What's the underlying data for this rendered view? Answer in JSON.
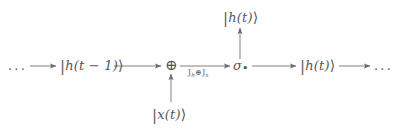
{
  "diagram": {
    "type": "unrolled-recurrence-flow",
    "title": "",
    "stroke_color": "#6b6b6b",
    "text_color": "#575757",
    "background": "#ffffff",
    "nodes": [
      {
        "id": "left-ellipsis",
        "name": "left-ellipsis",
        "text": "...",
        "x": 8,
        "y": 60
      },
      {
        "id": "prev-hidden-state",
        "name": "ket-h-t-minus-1",
        "text_parts": {
          "bar": "|",
          "body": "h(t − 1)",
          "rangle": "⟩"
        },
        "text": "|h(t − 1)⟩",
        "x": 60,
        "y": 58
      },
      {
        "id": "adder",
        "name": "circled-plus-operator",
        "text": "⊕",
        "x": 166,
        "y": 60
      },
      {
        "id": "activation",
        "name": "sigma-activation",
        "text": "σ•",
        "text_parts": {
          "symbol": "σ",
          "subscript": "•"
        },
        "x": 234,
        "y": 60
      },
      {
        "id": "next-hidden-state",
        "name": "ket-h-t-right",
        "text_parts": {
          "bar": "|",
          "body": "h(t)",
          "rangle": "⟩"
        },
        "text": "|h(t)⟩",
        "x": 300,
        "y": 58
      },
      {
        "id": "right-ellipsis",
        "name": "right-ellipsis",
        "text": "...",
        "x": 374,
        "y": 60
      },
      {
        "id": "output-hidden-state",
        "name": "ket-h-t-output",
        "text_parts": {
          "bar": "|",
          "body": "h(t)",
          "rangle": "⟩"
        },
        "text": "|h(t)⟩",
        "x": 224,
        "y": 10
      },
      {
        "id": "input-state",
        "name": "ket-x-t-input",
        "text_parts": {
          "bar": "|",
          "body": "x(t)",
          "rangle": "⟩"
        },
        "text": "|x(t)⟩",
        "x": 152,
        "y": 108
      }
    ],
    "edge_labels": [
      {
        "id": "transform-label",
        "name": "transform-operator-label",
        "parts": {
          "first_symbol": "J",
          "first_subscript": "h",
          "operator": "⊕",
          "second_symbol": "J",
          "second_subscript": "x"
        },
        "text": "J_h ⊕ J_x",
        "x": 188,
        "y": 69
      }
    ],
    "edges": [
      {
        "id": "e1",
        "name": "arrow-ellipsis-to-prev-state",
        "from": "left-ellipsis",
        "to": "prev-hidden-state",
        "direction": "right"
      },
      {
        "id": "e2",
        "name": "arrow-prev-state-to-adder",
        "from": "prev-hidden-state",
        "to": "adder",
        "direction": "right"
      },
      {
        "id": "e3",
        "name": "arrow-adder-to-activation",
        "from": "adder",
        "to": "activation",
        "direction": "right",
        "label": "transform-label"
      },
      {
        "id": "e4",
        "name": "arrow-activation-to-next-state",
        "from": "activation",
        "to": "next-hidden-state",
        "direction": "right"
      },
      {
        "id": "e5",
        "name": "arrow-next-state-to-ellipsis",
        "from": "next-hidden-state",
        "to": "right-ellipsis",
        "direction": "right"
      },
      {
        "id": "e6",
        "name": "arrow-activation-to-output",
        "from": "activation",
        "to": "output-hidden-state",
        "direction": "up"
      },
      {
        "id": "e7",
        "name": "arrow-input-to-adder",
        "from": "input-state",
        "to": "adder",
        "direction": "up"
      }
    ]
  }
}
